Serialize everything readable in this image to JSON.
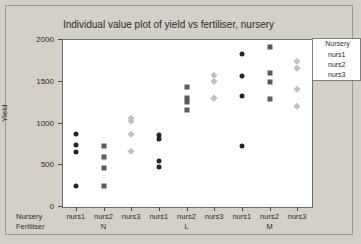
{
  "chart_data": {
    "type": "scatter",
    "title": "Individual value plot of yield vs fertiliser, nursery",
    "xlabel": "",
    "ylabel": "Yield",
    "ylim": [
      0,
      2000
    ],
    "yticks": [
      0,
      500,
      1000,
      1500,
      2000
    ],
    "grid": false,
    "legend_position": "right-top",
    "legend_title": "Nursery",
    "row_labels": [
      "Nursery",
      "Fertiliser"
    ],
    "group_labels": [
      "N",
      "L",
      "M"
    ],
    "categories": [
      "nurs1",
      "nurs2",
      "nurs3",
      "nurs1",
      "nurs2",
      "nurs3",
      "nurs1",
      "nurs2",
      "nurs3"
    ],
    "series": [
      {
        "name": "nurs1",
        "marker": "circle",
        "color": "#262626",
        "groups": [
          {
            "fertiliser": "N",
            "values": [
              862,
              731,
              647,
              240
            ]
          },
          {
            "fertiliser": "L",
            "values": [
              851,
              803,
              539,
              467
            ]
          },
          {
            "fertiliser": "M",
            "values": [
              1821,
              1557,
              1318,
              719
            ]
          }
        ]
      },
      {
        "name": "nurs2",
        "marker": "square",
        "color": "#5a5a5a",
        "groups": [
          {
            "fertiliser": "N",
            "values": [
              719,
              587,
              455,
              240
            ]
          },
          {
            "fertiliser": "L",
            "values": [
              1425,
              1294,
              1246,
              1150
            ]
          },
          {
            "fertiliser": "M",
            "values": [
              1905,
              1593,
              1485,
              1282
            ]
          }
        ]
      },
      {
        "name": "nurs3",
        "marker": "diamond",
        "color": "#c0c0c0",
        "groups": [
          {
            "fertiliser": "N",
            "values": [
              1054,
              1018,
              862,
              659
            ]
          },
          {
            "fertiliser": "L",
            "values": [
              1569,
              1497,
              1294,
              1294
            ]
          },
          {
            "fertiliser": "M",
            "values": [
              1737,
              1653,
              1402,
              1198
            ]
          }
        ]
      }
    ],
    "legend_entries": [
      {
        "label": "nurs1",
        "marker": "circle",
        "color": "#262626"
      },
      {
        "label": "nurs2",
        "marker": "square",
        "color": "#5a5a5a"
      },
      {
        "label": "nurs3",
        "marker": "diamond",
        "color": "#c0c0c0"
      }
    ]
  }
}
